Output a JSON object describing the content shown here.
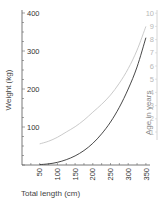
{
  "chart_data": {
    "type": "line",
    "title": "",
    "xlabel": "Total length (cm)",
    "ylabel": "Weight (kg)",
    "y2label": "Age in years",
    "xlim": [
      0,
      360
    ],
    "ylim": [
      0,
      400
    ],
    "y2lim": [
      0,
      10
    ],
    "x_ticks": [
      50,
      100,
      150,
      200,
      250,
      300,
      350
    ],
    "y_ticks": [
      100,
      200,
      300,
      400
    ],
    "y2_ticks": [
      1,
      2,
      3,
      4,
      5,
      6,
      7,
      8,
      9,
      10
    ],
    "grid": false,
    "series": [
      {
        "name": "Weight",
        "axis": "left",
        "color": "#333333",
        "x": [
          50,
          75,
          100,
          125,
          150,
          175,
          200,
          225,
          250,
          275,
          300,
          325,
          350
        ],
        "values": [
          1,
          3,
          7,
          14,
          24,
          38,
          57,
          82,
          113,
          152,
          200,
          258,
          335
        ]
      },
      {
        "name": "Age",
        "axis": "right",
        "color": "#bdbdbd",
        "x": [
          50,
          75,
          100,
          125,
          150,
          175,
          200,
          225,
          250,
          275,
          300,
          325,
          350
        ],
        "values": [
          0.1,
          0.3,
          0.6,
          1.0,
          1.4,
          1.9,
          2.5,
          3.1,
          3.8,
          4.7,
          5.8,
          7.2,
          9.0
        ]
      }
    ]
  },
  "axes": {
    "left": {
      "title": "Weight (kg)",
      "labels": [
        "100",
        "200",
        "300",
        "400"
      ]
    },
    "bottom": {
      "title": "Total length (cm)",
      "labels": [
        "50",
        "100",
        "150",
        "200",
        "250",
        "300",
        "350"
      ]
    },
    "right": {
      "title": "Age in years",
      "labels": [
        "1",
        "2",
        "3",
        "4",
        "5",
        "6",
        "7",
        "8",
        "9",
        "10"
      ]
    }
  }
}
